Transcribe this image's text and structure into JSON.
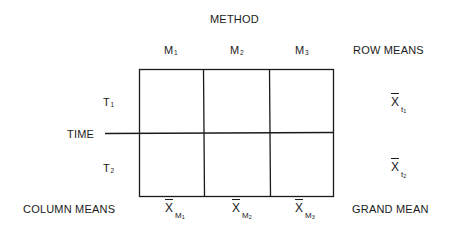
{
  "diagram": {
    "title": "METHOD",
    "factor_row_label": "TIME",
    "columns": [
      {
        "label": "M",
        "subscript": "1"
      },
      {
        "label": "M",
        "subscript": "2"
      },
      {
        "label": "M",
        "subscript": "3"
      }
    ],
    "rows": [
      {
        "label": "T",
        "subscript": "1"
      },
      {
        "label": "T",
        "subscript": "2"
      }
    ],
    "row_means_header": "ROW MEANS",
    "row_means": [
      {
        "symbol": "X",
        "subscript": "t",
        "sub_subscript": "1"
      },
      {
        "symbol": "X",
        "subscript": "t",
        "sub_subscript": "2"
      }
    ],
    "column_means_label": "COLUMN MEANS",
    "column_means": [
      {
        "symbol": "X",
        "subscript": "M",
        "sub_subscript": "1"
      },
      {
        "symbol": "X",
        "subscript": "M",
        "sub_subscript": "2"
      },
      {
        "symbol": "X",
        "subscript": "M",
        "sub_subscript": "3"
      }
    ],
    "grand_mean_label": "GRAND MEAN",
    "line_color": "#1a1a1a"
  }
}
